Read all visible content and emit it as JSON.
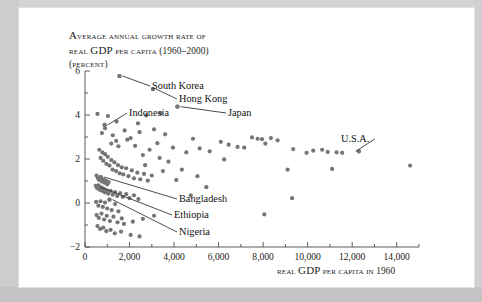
{
  "page": {
    "background_color": "#c9c9c9",
    "panel_color": "#ffffff"
  },
  "chart_data": {
    "type": "scatter",
    "title_lines": [
      "Average annual growth rate of",
      "real GDP per capita (1960–2000)",
      "(percent)"
    ],
    "title_line_1_a": "A",
    "title_line_1_b": "verage annual growth rate of",
    "title_line_2_a": "real ",
    "title_line_2_b": "GDP",
    "title_line_2_c": " per capita (1960–2000)",
    "title_line_3": "(percent)",
    "xlabel": "Real GDP per capita in 1960",
    "xlabel_a": "Real ",
    "xlabel_b": "GDP",
    "xlabel_c": " per capita in 1960",
    "ylabel": "percent",
    "xlim": [
      0,
      15000
    ],
    "ylim": [
      -2,
      6
    ],
    "x_ticks": [
      0,
      2000,
      4000,
      6000,
      8000,
      10000,
      12000,
      14000
    ],
    "x_tick_labels": [
      "0",
      "2,000",
      "4,000",
      "6,000",
      "8,000",
      "10,000",
      "12,000",
      "14,000"
    ],
    "x_minor_ticks": [
      1000,
      3000,
      5000,
      7000,
      9000,
      11000,
      13000,
      15000
    ],
    "y_ticks": [
      -2,
      0,
      2,
      4,
      6
    ],
    "y_tick_labels": [
      "−2",
      "0",
      "2",
      "4",
      "6"
    ],
    "y_minor_ticks": [
      -1,
      1,
      3,
      5
    ],
    "grid": false,
    "legend": false,
    "marker_color": "#757575",
    "marker_size": 4.2,
    "annotations": [
      {
        "label": "South Korea",
        "x": 1550,
        "y": 5.77,
        "label_px_x": 133,
        "label_px_y": 72,
        "leader": true
      },
      {
        "label": "Hong Kong",
        "x": 3050,
        "y": 5.18,
        "label_px_x": 160,
        "label_px_y": 85,
        "leader": true
      },
      {
        "label": "Indonesia",
        "x": 880,
        "y": 3.55,
        "label_px_x": 110,
        "label_px_y": 99,
        "leader": true
      },
      {
        "label": "Japan",
        "x": 4150,
        "y": 4.38,
        "label_px_x": 209,
        "label_px_y": 99,
        "leader": true
      },
      {
        "label": "U.S.A.",
        "x": 12300,
        "y": 2.35,
        "label_px_x": 322,
        "label_px_y": 125,
        "leader": true
      },
      {
        "label": "Bangladesh",
        "x": 720,
        "y": 1.18,
        "label_px_x": 160,
        "label_px_y": 185,
        "leader": true
      },
      {
        "label": "Ethiopia",
        "x": 550,
        "y": 0.72,
        "label_px_x": 155,
        "label_px_y": 201,
        "leader": true
      },
      {
        "label": "Nigeria",
        "x": 1100,
        "y": 0.15,
        "label_px_x": 160,
        "label_px_y": 218,
        "leader": true
      }
    ],
    "points": [
      [
        1550,
        5.77
      ],
      [
        3050,
        5.18
      ],
      [
        4150,
        4.38
      ],
      [
        880,
        3.55
      ],
      [
        900,
        3.4
      ],
      [
        560,
        4.05
      ],
      [
        1030,
        3.95
      ],
      [
        1420,
        3.7
      ],
      [
        2380,
        3.62
      ],
      [
        2750,
        3.98
      ],
      [
        3100,
        3.35
      ],
      [
        3400,
        4.08
      ],
      [
        3600,
        3.12
      ],
      [
        1780,
        3.3
      ],
      [
        2050,
        2.95
      ],
      [
        1180,
        2.7
      ],
      [
        1500,
        2.58
      ],
      [
        2250,
        2.6
      ],
      [
        2600,
        2.18
      ],
      [
        3250,
        2.72
      ],
      [
        3950,
        2.52
      ],
      [
        4550,
        2.3
      ],
      [
        4850,
        2.92
      ],
      [
        5150,
        2.48
      ],
      [
        5600,
        2.35
      ],
      [
        6100,
        2.78
      ],
      [
        6450,
        2.65
      ],
      [
        6850,
        2.55
      ],
      [
        7150,
        2.52
      ],
      [
        7500,
        2.98
      ],
      [
        7750,
        2.92
      ],
      [
        7950,
        2.9
      ],
      [
        8100,
        2.7
      ],
      [
        8350,
        2.95
      ],
      [
        8650,
        2.85
      ],
      [
        9350,
        2.45
      ],
      [
        9950,
        2.28
      ],
      [
        10250,
        2.38
      ],
      [
        10650,
        2.42
      ],
      [
        10900,
        2.32
      ],
      [
        11300,
        2.3
      ],
      [
        11550,
        2.28
      ],
      [
        12300,
        2.35
      ],
      [
        11100,
        1.55
      ],
      [
        14600,
        1.7
      ],
      [
        9100,
        1.52
      ],
      [
        8050,
        -0.52
      ],
      [
        9300,
        0.22
      ],
      [
        640,
        2.42
      ],
      [
        700,
        2.05
      ],
      [
        780,
        2.3
      ],
      [
        820,
        1.92
      ],
      [
        900,
        2.22
      ],
      [
        960,
        1.78
      ],
      [
        1020,
        2.1
      ],
      [
        1100,
        1.7
      ],
      [
        1180,
        1.95
      ],
      [
        1240,
        1.52
      ],
      [
        1320,
        1.85
      ],
      [
        1400,
        1.45
      ],
      [
        1480,
        1.72
      ],
      [
        1560,
        1.35
      ],
      [
        1650,
        1.62
      ],
      [
        1720,
        1.3
      ],
      [
        1850,
        1.58
      ],
      [
        1950,
        1.22
      ],
      [
        2100,
        1.48
      ],
      [
        2200,
        1.12
      ],
      [
        2350,
        1.38
      ],
      [
        2480,
        1.08
      ],
      [
        2650,
        1.32
      ],
      [
        2820,
        1.02
      ],
      [
        3000,
        1.25
      ],
      [
        520,
        1.25
      ],
      [
        580,
        1.12
      ],
      [
        640,
        1.05
      ],
      [
        700,
        1.18
      ],
      [
        760,
        0.98
      ],
      [
        820,
        1.08
      ],
      [
        880,
        0.92
      ],
      [
        940,
        1.02
      ],
      [
        1000,
        0.85
      ],
      [
        1060,
        0.95
      ],
      [
        480,
        0.78
      ],
      [
        540,
        0.68
      ],
      [
        600,
        0.8
      ],
      [
        660,
        0.6
      ],
      [
        720,
        0.72
      ],
      [
        780,
        0.55
      ],
      [
        840,
        0.65
      ],
      [
        900,
        0.48
      ],
      [
        980,
        0.58
      ],
      [
        1050,
        0.42
      ],
      [
        1150,
        0.55
      ],
      [
        1250,
        0.38
      ],
      [
        1350,
        0.5
      ],
      [
        1450,
        0.32
      ],
      [
        1580,
        0.45
      ],
      [
        1700,
        0.28
      ],
      [
        1850,
        0.4
      ],
      [
        2000,
        0.22
      ],
      [
        2200,
        0.35
      ],
      [
        2400,
        0.18
      ],
      [
        500,
        0.05
      ],
      [
        600,
        -0.12
      ],
      [
        700,
        0.08
      ],
      [
        800,
        -0.18
      ],
      [
        900,
        0.02
      ],
      [
        1000,
        -0.25
      ],
      [
        1100,
        0.15
      ],
      [
        1200,
        -0.32
      ],
      [
        1350,
        -0.05
      ],
      [
        1500,
        -0.38
      ],
      [
        520,
        -0.55
      ],
      [
        620,
        -0.68
      ],
      [
        740,
        -0.48
      ],
      [
        860,
        -0.75
      ],
      [
        980,
        -0.58
      ],
      [
        1120,
        -0.82
      ],
      [
        1280,
        -0.62
      ],
      [
        1460,
        -0.88
      ],
      [
        1650,
        -0.7
      ],
      [
        560,
        -1.05
      ],
      [
        680,
        -1.18
      ],
      [
        820,
        -1.12
      ],
      [
        960,
        -1.28
      ],
      [
        1150,
        -1.22
      ],
      [
        1340,
        -1.38
      ],
      [
        1620,
        -1.3
      ],
      [
        2050,
        -1.45
      ],
      [
        2450,
        -1.52
      ],
      [
        1750,
        -0.95
      ],
      [
        2150,
        -0.85
      ],
      [
        2600,
        -0.72
      ],
      [
        3100,
        -0.58
      ],
      [
        1400,
        2.82
      ],
      [
        1900,
        2.88
      ],
      [
        2450,
        3.22
      ],
      [
        1250,
        3.08
      ],
      [
        760,
        3.18
      ],
      [
        4350,
        1.52
      ],
      [
        5050,
        1.22
      ],
      [
        5450,
        0.72
      ],
      [
        4750,
        0.35
      ],
      [
        6250,
        1.98
      ],
      [
        3750,
        1.88
      ],
      [
        3500,
        1.45
      ],
      [
        4100,
        1.05
      ],
      [
        2900,
        2.42
      ],
      [
        3350,
        2.05
      ],
      [
        2700,
        1.72
      ]
    ]
  }
}
